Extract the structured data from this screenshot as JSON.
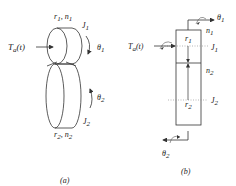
{
  "figure": {
    "panel_a": {
      "caption": "(a)",
      "labels": {
        "gear1": "r",
        "gear1_r_sub": "1",
        "gear1_n": "n",
        "gear1_n_sub": "1",
        "inertia1": "J",
        "inertia1_sub": "1",
        "angle1": "θ",
        "angle1_sub": "1",
        "torque": "T",
        "torque_sub": "a",
        "torque_arg": "(t)",
        "angle2": "θ",
        "angle2_sub": "2",
        "inertia2": "J",
        "inertia2_sub": "2",
        "gear2": "r",
        "gear2_r_sub": "2",
        "gear2_n": "n",
        "gear2_n_sub": "2"
      }
    },
    "panel_b": {
      "caption": "(b)",
      "labels": {
        "angle1": "θ",
        "angle1_sub": "1",
        "n1": "n",
        "n1_sub": "1",
        "r1": "r",
        "r1_sub": "1",
        "J1": "J",
        "J1_sub": "1",
        "torque": "T",
        "torque_sub": "a",
        "torque_arg": "(t)",
        "n2": "n",
        "n2_sub": "2",
        "r2": "r",
        "r2_sub": "2",
        "J2": "J",
        "J2_sub": "2",
        "angle2": "θ",
        "angle2_sub": "2"
      }
    }
  },
  "colors": {
    "line": "#333333",
    "dotted": "#888888",
    "text": "#222222"
  }
}
